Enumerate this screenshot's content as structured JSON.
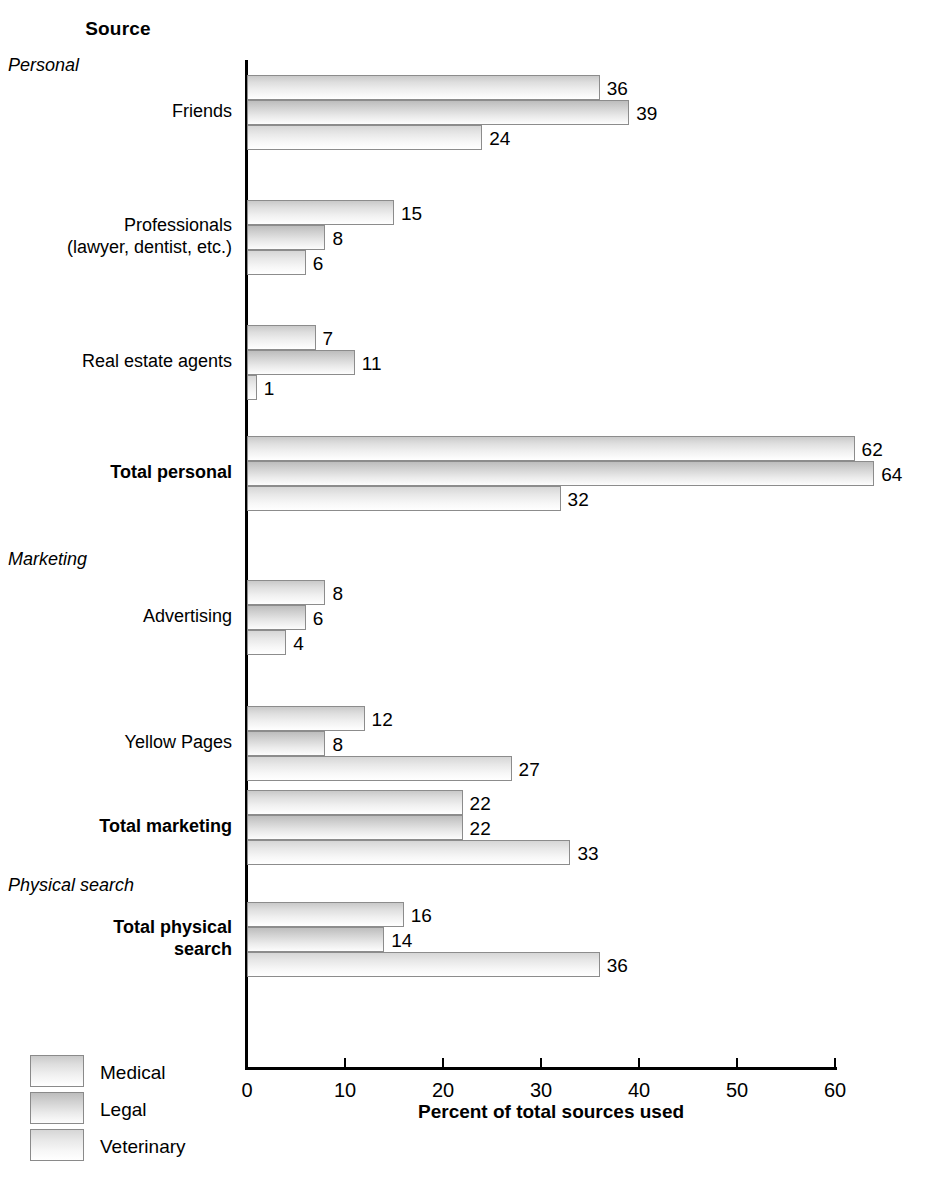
{
  "header": {
    "source_title": "Source",
    "axis_title": "Percent of total sources used"
  },
  "bands": [
    {
      "id": "personal",
      "label": "Personal"
    },
    {
      "id": "marketing",
      "label": "Marketing"
    },
    {
      "id": "physical",
      "label": "Physical search"
    }
  ],
  "legend": {
    "position": "bottom-left",
    "items": [
      {
        "name": "Medical",
        "swatch": "medical-swatch"
      },
      {
        "name": "Legal",
        "swatch": "legal-swatch"
      },
      {
        "name": "Veterinary",
        "swatch": "veterinary-swatch"
      }
    ]
  },
  "categories_display": [
    {
      "label": "Friends",
      "bold": false
    },
    {
      "label": "Professionals\n(lawyer, dentist, etc.)",
      "bold": false
    },
    {
      "label": "Real estate agents",
      "bold": false
    },
    {
      "label": "Total personal",
      "bold": true
    },
    {
      "label": "Advertising",
      "bold": false
    },
    {
      "label": "Yellow Pages",
      "bold": false
    },
    {
      "label": "Total marketing",
      "bold": true
    },
    {
      "label": "Total physical\nsearch",
      "bold": true
    }
  ],
  "chart_data": {
    "type": "bar",
    "orientation": "horizontal",
    "title": "Source",
    "xlabel": "Percent of total sources used",
    "ylabel": "Source",
    "xlim": [
      0,
      60
    ],
    "xticks": [
      0,
      10,
      20,
      30,
      40,
      50,
      60
    ],
    "grid": false,
    "legend_position": "bottom-left",
    "categories": [
      "Friends",
      "Professionals (lawyer, dentist, etc.)",
      "Real estate agents",
      "Total personal",
      "Advertising",
      "Yellow Pages",
      "Total marketing",
      "Total physical search"
    ],
    "series": [
      {
        "name": "Medical",
        "values": [
          36,
          15,
          7,
          62,
          8,
          12,
          22,
          16
        ]
      },
      {
        "name": "Legal",
        "values": [
          39,
          8,
          11,
          64,
          6,
          8,
          22,
          14
        ]
      },
      {
        "name": "Veterinary",
        "values": [
          24,
          6,
          1,
          32,
          4,
          27,
          33,
          36
        ]
      }
    ]
  },
  "colors": {
    "bar_top": "#c9c9c9",
    "bar_bottom": "#ffffff",
    "bar_border": "#8c8c8c",
    "axis": "#000000",
    "text": "#000000",
    "background": "#ffffff"
  },
  "caption": ""
}
